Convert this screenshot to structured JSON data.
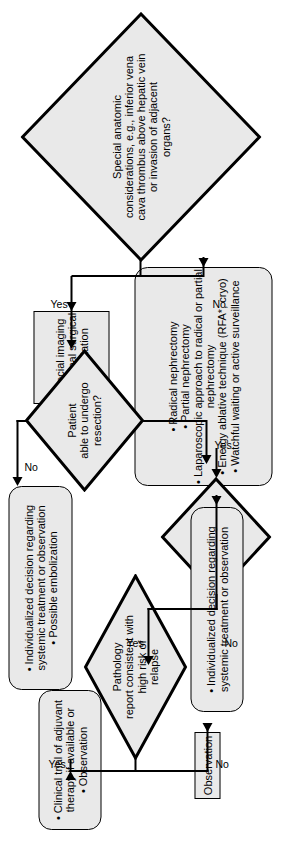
{
  "diagram": {
    "orientation": "rotated-90",
    "colors": {
      "node_fill": "#e9e9e9",
      "stroke": "#000000",
      "background": "#ffffff"
    },
    "nodes": {
      "special_anatomic": {
        "shape": "diamond",
        "text": "Special anatomic\nconsiderations, e.g., inferior vena\ncava thrombus above hepatic vein\nor invasion of adjacent\norgans?"
      },
      "special_imaging": {
        "shape": "rectangle",
        "text": "Special imaging\nAdditional surgical\nconsultation"
      },
      "treatment_options": {
        "shape": "rounded-rectangle",
        "items": [
          "Radical nephrectomy",
          "Partial nephrectomy",
          "Laparoscopic approach to radical or partial",
          "nephrectomy",
          "Energy ablative technique (RFA*, cryo)",
          "Watchful waiting or active surveillance"
        ],
        "continuation_index": 3
      },
      "patient_able": {
        "shape": "diamond",
        "text": "Patient\nable to undergo\nresection?"
      },
      "individualized_left": {
        "shape": "rounded-rectangle",
        "items": [
          "Individualized decision regarding",
          "systemic treatment or observation",
          "Possible embolization"
        ],
        "continuation_index": 1
      },
      "complete_resection": {
        "shape": "diamond",
        "text": "Complete\nresection?"
      },
      "individualized_right": {
        "shape": "rounded-rectangle",
        "items": [
          "Individualized decision regarding",
          "systemic treatment or observation"
        ],
        "continuation_index": 1
      },
      "pathology_report": {
        "shape": "diamond",
        "text": "Pathology\nreport consistent with\nhigh risk of\nrelapse"
      },
      "clinical_trial": {
        "shape": "rounded-rectangle",
        "items": [
          "Clinical trial of adjuvant",
          "therapy if available or",
          "Observation"
        ],
        "continuation_index": 1
      },
      "observation": {
        "shape": "rectangle",
        "text": "Observation"
      }
    },
    "edge_labels": {
      "anatomic_yes": "Yes",
      "anatomic_no": "No",
      "patient_yes": "Yes",
      "patient_no": "No",
      "imaging_to_treatment_no": "No",
      "resection_yes": "Yes",
      "resection_no": "No",
      "pathology_yes": "Yes",
      "pathology_no": "No"
    }
  }
}
